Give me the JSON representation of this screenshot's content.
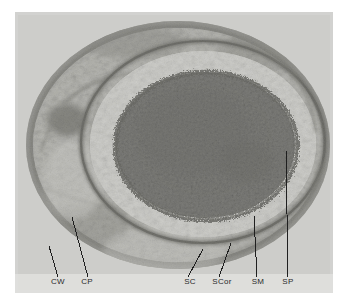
{
  "figure": {
    "type": "transmission-electron-micrograph",
    "background_color": "#ffffff",
    "plate_color": "#c9c9c7",
    "ink_color": "#2a2a2a"
  },
  "labels": [
    {
      "id": "cw",
      "text": "CW",
      "x": 58,
      "y": 284,
      "line": {
        "x1": 58,
        "y1": 277,
        "x2": 49,
        "y2": 246
      }
    },
    {
      "id": "cp",
      "text": "CP",
      "x": 87,
      "y": 284,
      "line": {
        "x1": 88,
        "y1": 277,
        "x2": 72,
        "y2": 217
      }
    },
    {
      "id": "sc",
      "text": "SC",
      "x": 190,
      "y": 284,
      "line": {
        "x1": 188,
        "y1": 277,
        "x2": 203,
        "y2": 249
      }
    },
    {
      "id": "scor",
      "text": "SCor",
      "x": 222,
      "y": 284,
      "line": {
        "x1": 219,
        "y1": 277,
        "x2": 231,
        "y2": 243
      }
    },
    {
      "id": "sm",
      "text": "SM",
      "x": 258,
      "y": 284,
      "line": {
        "x1": 257,
        "y1": 277,
        "x2": 254,
        "y2": 216
      }
    },
    {
      "id": "sp",
      "text": "SP",
      "x": 288,
      "y": 284,
      "line": {
        "x1": 288,
        "y1": 277,
        "x2": 286,
        "y2": 150
      }
    }
  ],
  "structures": {
    "cell_wall": "CW",
    "cytoplasm": "CP",
    "spore_coat": "SC",
    "spore_cortex": "SCor",
    "spore_membrane": "SM",
    "spore_protoplast": "SP"
  },
  "micrograph_regions": [
    {
      "name": "outer-plate-background",
      "tone": "light-gray"
    },
    {
      "name": "mother-cell-wall-ring",
      "tone": "dark-gray"
    },
    {
      "name": "mother-cell-cytoplasm",
      "tone": "mottled-gray"
    },
    {
      "name": "spore-coat-ring",
      "tone": "very-dark"
    },
    {
      "name": "spore-cortex-ring",
      "tone": "pale"
    },
    {
      "name": "spore-membrane-ring",
      "tone": "dark-thin"
    },
    {
      "name": "spore-protoplast-core",
      "tone": "dark-granular"
    }
  ]
}
